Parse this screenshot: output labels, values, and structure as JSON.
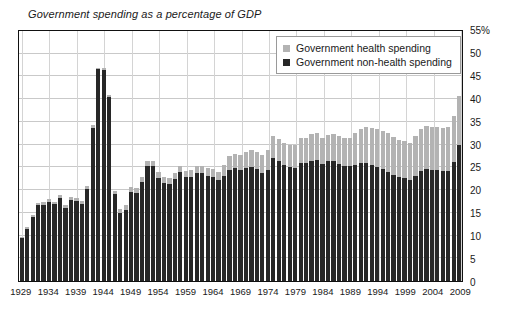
{
  "chart_data": {
    "type": "bar",
    "subtype": "stacked-bar",
    "title": "Government spending as a percentage of GDP",
    "xlabel": "",
    "ylabel": "",
    "ylim": [
      0,
      55
    ],
    "ytick_values": [
      0,
      5,
      10,
      15,
      20,
      25,
      30,
      35,
      40,
      45,
      50,
      55
    ],
    "ytick_labels": [
      "0",
      "5",
      "10",
      "15",
      "20",
      "25",
      "30",
      "35",
      "40",
      "45",
      "50",
      "55%"
    ],
    "ytick_side": "right",
    "xtick_labels": [
      "1929",
      "1934",
      "1939",
      "1944",
      "1949",
      "1954",
      "1959",
      "1964",
      "1969",
      "1974",
      "1979",
      "1984",
      "1989",
      "1994",
      "1999",
      "2004",
      "2009"
    ],
    "xtick_step_years": 5,
    "grid": "both",
    "legend_position": "top-right-inside",
    "colors": {
      "health": "#b3b3b3",
      "nonhealth": "#272727",
      "grid": "#c9c9c9",
      "frame": "#111111",
      "background": "#ffffff"
    },
    "legend": [
      {
        "name": "Government health spending",
        "color": "#b3b3b3"
      },
      {
        "name": "Government non-health spending",
        "color": "#272727"
      }
    ],
    "x": [
      1929,
      1930,
      1931,
      1932,
      1933,
      1934,
      1935,
      1936,
      1937,
      1938,
      1939,
      1940,
      1941,
      1942,
      1943,
      1944,
      1945,
      1946,
      1947,
      1948,
      1949,
      1950,
      1951,
      1952,
      1953,
      1954,
      1955,
      1956,
      1957,
      1958,
      1959,
      1960,
      1961,
      1962,
      1963,
      1964,
      1965,
      1966,
      1967,
      1968,
      1969,
      1970,
      1971,
      1972,
      1973,
      1974,
      1975,
      1976,
      1977,
      1978,
      1979,
      1980,
      1981,
      1982,
      1983,
      1984,
      1985,
      1986,
      1987,
      1988,
      1989,
      1990,
      1991,
      1992,
      1993,
      1994,
      1995,
      1996,
      1997,
      1998,
      1999,
      2000,
      2001,
      2002,
      2003,
      2004,
      2005,
      2006,
      2007,
      2008,
      2009
    ],
    "series": [
      {
        "name": "Government non-health spending",
        "color": "#272727",
        "values": [
          9.3,
          11.4,
          14.0,
          16.5,
          16.6,
          17.3,
          16.7,
          18.1,
          16.0,
          17.6,
          17.4,
          16.8,
          20.1,
          33.5,
          46.2,
          46.0,
          40.2,
          19.0,
          14.9,
          15.6,
          19.5,
          19.3,
          21.6,
          25.0,
          25.2,
          22.5,
          21.4,
          21.2,
          22.2,
          23.8,
          22.6,
          22.8,
          23.5,
          23.6,
          23.0,
          22.7,
          22.0,
          23.0,
          24.3,
          24.7,
          24.2,
          24.7,
          24.8,
          24.4,
          23.6,
          24.3,
          26.9,
          26.1,
          25.3,
          24.8,
          24.6,
          25.8,
          25.8,
          26.3,
          26.4,
          25.5,
          26.1,
          26.1,
          25.6,
          25.2,
          25.0,
          25.4,
          25.7,
          25.7,
          25.3,
          24.8,
          24.4,
          23.9,
          23.1,
          22.6,
          22.4,
          22.0,
          23.0,
          24.0,
          24.4,
          24.3,
          24.2,
          24.0,
          24.1,
          26.0,
          29.7
        ]
      },
      {
        "name": "Government health spending",
        "color": "#b3b3b3",
        "values": [
          0.3,
          0.4,
          0.5,
          0.6,
          0.6,
          0.6,
          0.6,
          0.7,
          0.7,
          0.7,
          0.7,
          0.7,
          0.6,
          0.5,
          0.4,
          0.4,
          0.5,
          0.7,
          0.8,
          0.9,
          1.0,
          1.1,
          1.1,
          1.1,
          1.1,
          1.2,
          1.2,
          1.2,
          1.3,
          1.4,
          1.4,
          1.5,
          1.6,
          1.6,
          1.7,
          1.7,
          1.8,
          2.3,
          2.9,
          3.1,
          3.2,
          3.4,
          3.7,
          3.8,
          3.8,
          4.2,
          4.8,
          4.9,
          4.9,
          4.9,
          5.0,
          5.4,
          5.5,
          5.7,
          5.8,
          5.7,
          5.8,
          5.9,
          6.0,
          6.1,
          6.3,
          6.8,
          7.4,
          7.9,
          8.1,
          8.3,
          8.4,
          8.4,
          8.3,
          8.2,
          8.2,
          8.2,
          8.6,
          9.1,
          9.4,
          9.4,
          9.4,
          9.4,
          9.5,
          10.0,
          10.6
        ]
      }
    ]
  }
}
